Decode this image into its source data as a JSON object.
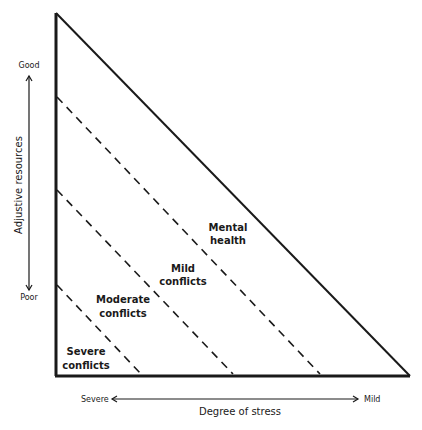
{
  "diagram": {
    "type": "triangle-zones",
    "y_axis": {
      "title": "Adjustive resources",
      "top_label": "Good",
      "bottom_label": "Poor"
    },
    "x_axis": {
      "title": "Degree of stress",
      "left_label": "Severe",
      "right_label": "Mild"
    },
    "zones": [
      {
        "line1": "Severe",
        "line2": "conflicts"
      },
      {
        "line1": "Moderate",
        "line2": "conflicts"
      },
      {
        "line1": "Mild",
        "line2": "conflicts"
      },
      {
        "line1": "Mental",
        "line2": "health"
      }
    ],
    "colors": {
      "line": "#1a1a1a",
      "background": "#ffffff"
    }
  }
}
